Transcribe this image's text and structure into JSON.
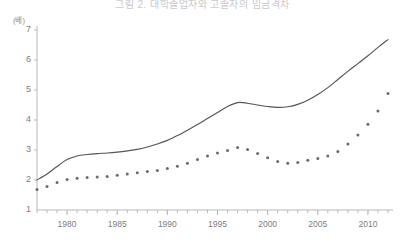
{
  "chart_data": {
    "type": "line",
    "title": "그림 2. 대학졸업자와 고졸자의 임금격차",
    "xlabel": "",
    "ylabel": "(배)",
    "xlim": [
      1977,
      2012.5
    ],
    "ylim": [
      1,
      7
    ],
    "grid": false,
    "legend": "none",
    "y_ticks": [
      1,
      2,
      3,
      4,
      5,
      6,
      7
    ],
    "x_ticks": [
      1980,
      1985,
      1990,
      1995,
      2000,
      2005,
      2010
    ],
    "x_minor_tick_interval": 1,
    "colors": {
      "line": "#555555",
      "dots": "#6b6b6b",
      "axis": "#b8b8b8",
      "text": "#7d7d7d"
    },
    "x": [
      1977,
      1978,
      1979,
      1980,
      1981,
      1982,
      1983,
      1984,
      1985,
      1986,
      1987,
      1988,
      1989,
      1990,
      1991,
      1992,
      1993,
      1994,
      1995,
      1996,
      1997,
      1998,
      1999,
      2000,
      2001,
      2002,
      2003,
      2004,
      2005,
      2006,
      2007,
      2008,
      2009,
      2010,
      2011,
      2012
    ],
    "series": [
      {
        "name": "solid-line",
        "style": "line",
        "values": [
          2.0,
          2.2,
          2.45,
          2.68,
          2.8,
          2.85,
          2.88,
          2.9,
          2.93,
          2.97,
          3.02,
          3.1,
          3.2,
          3.32,
          3.48,
          3.66,
          3.85,
          4.05,
          4.25,
          4.45,
          4.58,
          4.56,
          4.5,
          4.45,
          4.42,
          4.44,
          4.52,
          4.66,
          4.85,
          5.08,
          5.35,
          5.62,
          5.88,
          6.14,
          6.42,
          6.68
        ]
      },
      {
        "name": "dotted-series",
        "style": "dots",
        "values": [
          1.68,
          1.78,
          1.92,
          2.02,
          2.06,
          2.08,
          2.1,
          2.12,
          2.16,
          2.2,
          2.24,
          2.28,
          2.32,
          2.38,
          2.46,
          2.56,
          2.68,
          2.8,
          2.9,
          2.98,
          3.08,
          3.02,
          2.88,
          2.74,
          2.62,
          2.56,
          2.58,
          2.66,
          2.72,
          2.8,
          2.95,
          3.2,
          3.5,
          3.86,
          4.3,
          4.88
        ]
      }
    ]
  }
}
